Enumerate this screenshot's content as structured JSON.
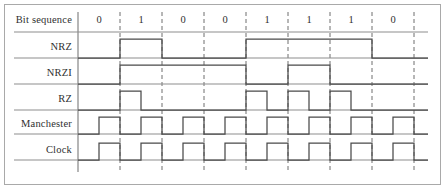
{
  "figure": {
    "background_color": "#ffffff",
    "wave_color": "#4a4a4a",
    "baseline_color": "#8d8d8d",
    "grid_color": "#6e6e6e",
    "text_color": "#2f2f2f"
  },
  "bit_sequence": {
    "label": "Bit sequence",
    "bits": [
      "0",
      "1",
      "0",
      "0",
      "1",
      "1",
      "1",
      "0"
    ]
  },
  "rows": [
    {
      "label": "NRZ"
    },
    {
      "label": "NRZI"
    },
    {
      "label": "RZ"
    },
    {
      "label": "Manchester"
    },
    {
      "label": "Clock"
    }
  ],
  "chart_data": {
    "type": "line",
    "xlabel": "Bit sequence",
    "ylabel": "",
    "grid": true,
    "legend": "none",
    "categories": [
      "0",
      "1",
      "0",
      "0",
      "1",
      "1",
      "1",
      "0"
    ],
    "bit_count": 8,
    "levels": [
      0,
      1
    ],
    "half_bit_resolution": true,
    "series": [
      {
        "name": "NRZ",
        "encoding": "non-return-to-zero",
        "half_bit_values": [
          0,
          0,
          1,
          1,
          0,
          0,
          0,
          0,
          1,
          1,
          1,
          1,
          1,
          1,
          0,
          0
        ]
      },
      {
        "name": "NRZI",
        "encoding": "non-return-to-zero inverted",
        "half_bit_values": [
          0,
          0,
          1,
          1,
          1,
          1,
          1,
          1,
          0,
          0,
          1,
          1,
          0,
          0,
          0,
          0
        ]
      },
      {
        "name": "RZ",
        "encoding": "return-to-zero",
        "half_bit_values": [
          0,
          0,
          1,
          0,
          0,
          0,
          0,
          0,
          1,
          0,
          1,
          0,
          1,
          0,
          0,
          0
        ]
      },
      {
        "name": "Manchester",
        "encoding": "manchester",
        "half_bit_values": [
          1,
          0,
          1,
          0,
          1,
          0,
          1,
          0,
          1,
          0,
          1,
          0,
          1,
          0,
          1,
          0
        ],
        "phase_offset_half_bits": 1
      },
      {
        "name": "Clock",
        "encoding": "clock",
        "half_bit_values": [
          1,
          0,
          1,
          0,
          1,
          0,
          1,
          0,
          1,
          0,
          1,
          0,
          1,
          0,
          1,
          0
        ],
        "phase_offset_half_bits": 1,
        "cycles_per_bit": 1
      }
    ]
  },
  "geometry": {
    "left_axis_x": 78,
    "right_edge_x": 428,
    "cell_width": 42,
    "bit_row_y": 21,
    "bit_baseline_y": 32,
    "row_baselines": [
      58,
      84,
      110,
      134,
      160
    ],
    "row_heights": [
      19,
      19,
      19,
      17,
      17
    ],
    "label_x": 72
  }
}
